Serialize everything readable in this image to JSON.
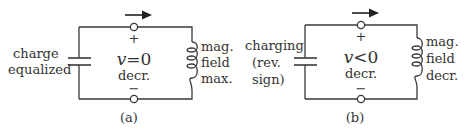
{
  "figure": {
    "panels": [
      {
        "id": "a",
        "caption": "(a)",
        "capacitor_label": [
          "charge",
          "equalized"
        ],
        "voltage_symbol": "v",
        "voltage_relation": "=0",
        "voltage_trend": "decr.",
        "inductor_label": [
          "mag.",
          "field",
          "max."
        ],
        "top_terminal_sign": "+",
        "bottom_terminal_sign": "−",
        "current_arrow": "right"
      },
      {
        "id": "b",
        "caption": "(b)",
        "capacitor_label": [
          "charging",
          "(rev.",
          "sign)"
        ],
        "voltage_symbol": "v",
        "voltage_relation": "<0",
        "voltage_trend": "decr.",
        "inductor_label": [
          "mag.",
          "field",
          "decr."
        ],
        "top_terminal_sign": "+",
        "bottom_terminal_sign": "−",
        "current_arrow": "right"
      }
    ],
    "colors": {
      "ink": "#3a3a3a",
      "text": "#333333",
      "background": "#ffffff"
    }
  }
}
